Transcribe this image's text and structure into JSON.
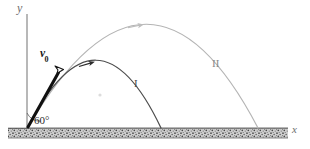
{
  "figure": {
    "background_color": "#ffffff"
  },
  "axes": {
    "y_axis_label": "y",
    "x_axis_label": "x",
    "axis_color": "#8c8c8c",
    "origin": {
      "x": 27,
      "y": 128
    },
    "y_axis_top": {
      "x": 27,
      "y": 14
    },
    "x_axis_right": {
      "x": 288,
      "y": 128
    }
  },
  "ground": {
    "label": "hatched-ground",
    "top_y": 128,
    "bottom_y": 138,
    "left_x": 8,
    "right_x": 288,
    "fill_color": "#b5b5b5",
    "edge_color": "#4a4a4a"
  },
  "vector": {
    "label_text": "v",
    "label_subscript": "0",
    "color": "#111111",
    "tail": {
      "x": 28,
      "y": 127
    },
    "tip": {
      "x": 61,
      "y": 68
    },
    "arrowhead_style": "hollow-outlined"
  },
  "angle": {
    "label": "60°",
    "value": 60,
    "unit": "degrees",
    "vertex": {
      "x": 27,
      "y": 128
    }
  },
  "trajectories": [
    {
      "id": "I",
      "label": "I",
      "color": "#4a4a4a",
      "stroke_width": 1.2,
      "launch": {
        "x": 28,
        "y": 127
      },
      "apex": {
        "x": 98,
        "y": 62
      },
      "landing": {
        "x": 161,
        "y": 128
      },
      "arrow_at": {
        "x": 91,
        "y": 63
      },
      "arrow_color": "#2a2a2a",
      "label_position": {
        "x": 134,
        "y": 78
      }
    },
    {
      "id": "II",
      "label": "II",
      "color": "#b0b0b0",
      "stroke_width": 1.2,
      "launch": {
        "x": 28,
        "y": 127
      },
      "apex": {
        "x": 150,
        "y": 24
      },
      "landing": {
        "x": 258,
        "y": 128
      },
      "arrow_at": {
        "x": 137,
        "y": 25
      },
      "arrow_color": "#bdbdbd",
      "label_position": {
        "x": 212,
        "y": 58
      }
    }
  ],
  "artifacts": {
    "faint_dot": {
      "x": 100,
      "y": 95,
      "color": "#d8d8d8"
    }
  }
}
